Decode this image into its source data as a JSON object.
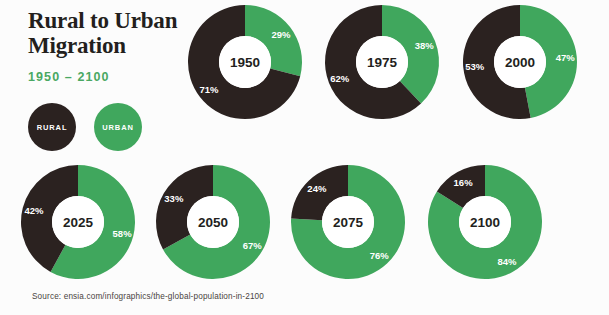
{
  "header": {
    "title_line1": "Rural to Urban",
    "title_line2": "Migration",
    "subtitle": "1950 – 2100"
  },
  "legend": {
    "rural_label": "RURAL",
    "urban_label": "URBAN",
    "rural_color": "#2b2220",
    "urban_color": "#40a75d"
  },
  "source": {
    "text": "Source: ensia.com/infographics/the-global-population-in-2100"
  },
  "chart_data": {
    "type": "pie",
    "title": "Rural to Urban Migration",
    "subtitle": "1950 – 2100",
    "series_names": [
      "RURAL",
      "URBAN"
    ],
    "colors": {
      "rural": "#2b2220",
      "urban": "#40a75d"
    },
    "units": "percent of world population",
    "charts": [
      {
        "year": "1950",
        "rural": 71,
        "urban": 29,
        "rural_label": "71%",
        "urban_label": "29%",
        "cx": 245,
        "cy": 62,
        "r": 57,
        "hole": 26,
        "row": 0
      },
      {
        "year": "1975",
        "rural": 62,
        "urban": 38,
        "rural_label": "62%",
        "urban_label": "38%",
        "cx": 382,
        "cy": 62,
        "r": 57,
        "hole": 26,
        "row": 0
      },
      {
        "year": "2000",
        "rural": 53,
        "urban": 47,
        "rural_label": "53%",
        "urban_label": "47%",
        "cx": 520,
        "cy": 62,
        "r": 57,
        "hole": 26,
        "row": 0
      },
      {
        "year": "2025",
        "rural": 42,
        "urban": 58,
        "rural_label": "42%",
        "urban_label": "58%",
        "cx": 78,
        "cy": 222,
        "r": 57,
        "hole": 26,
        "row": 1
      },
      {
        "year": "2050",
        "rural": 33,
        "urban": 67,
        "rural_label": "33%",
        "urban_label": "67%",
        "cx": 213,
        "cy": 222,
        "r": 57,
        "hole": 26,
        "row": 1
      },
      {
        "year": "2075",
        "rural": 24,
        "urban": 76,
        "rural_label": "24%",
        "urban_label": "76%",
        "cx": 348,
        "cy": 222,
        "r": 57,
        "hole": 26,
        "row": 1
      },
      {
        "year": "2100",
        "rural": 16,
        "urban": 84,
        "rural_label": "16%",
        "urban_label": "84%",
        "cx": 485,
        "cy": 222,
        "r": 57,
        "hole": 26,
        "row": 1
      }
    ]
  }
}
